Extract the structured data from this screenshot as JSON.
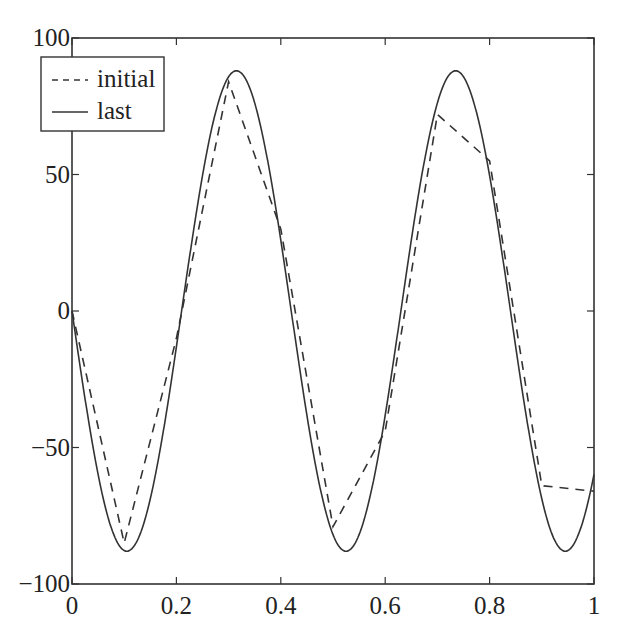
{
  "chart_data": {
    "type": "line",
    "title": "",
    "xlabel": "",
    "ylabel": "",
    "xlim": [
      0,
      1
    ],
    "ylim": [
      -100,
      100
    ],
    "grid": false,
    "legend_position": "upper left",
    "x_ticks": [
      0,
      0.2,
      0.4,
      0.6,
      0.8,
      1
    ],
    "x_tick_labels": [
      "0",
      "0.2",
      "0.4",
      "0.6",
      "0.8",
      "1"
    ],
    "y_ticks": [
      100,
      50,
      0,
      -50,
      -100
    ],
    "y_tick_labels": [
      "100",
      "50",
      "0",
      "-50",
      "-100"
    ],
    "series": [
      {
        "name": "initial",
        "style": "dashed",
        "color": "#333333",
        "x": [
          0,
          0.1,
          0.2,
          0.3,
          0.4,
          0.5,
          0.6,
          0.7,
          0.8,
          0.9,
          1.0
        ],
        "y": [
          0,
          -85,
          -10,
          84,
          30,
          -79,
          -44,
          72,
          55,
          -64,
          -66
        ]
      },
      {
        "name": "last",
        "style": "solid",
        "color": "#333333",
        "function": "y = -88 * sin(2*pi*x/0.42)",
        "amplitude": 88,
        "period": 0.42,
        "x": [
          0,
          0.105,
          0.2,
          0.315,
          0.4,
          0.525,
          0.6,
          0.735,
          0.8,
          0.945,
          1.0
        ],
        "y": [
          0,
          -88,
          -13,
          88,
          27,
          -88,
          -43,
          88,
          55,
          -88,
          -62
        ]
      }
    ]
  },
  "legend": {
    "items": [
      {
        "label": "initial",
        "style": "dashed"
      },
      {
        "label": "last",
        "style": "solid"
      }
    ]
  }
}
